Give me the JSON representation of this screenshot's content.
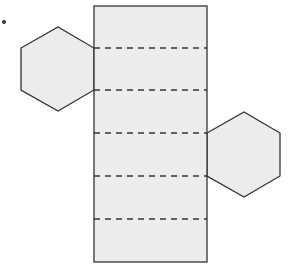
{
  "figure": {
    "colors": {
      "fill": "#ececec",
      "stroke": "#333333",
      "background": "#ffffff"
    },
    "bullet": {
      "cx": 4,
      "cy": 22,
      "r": 2
    },
    "rectangle": {
      "x": 94,
      "y": 6,
      "width": 113,
      "height": 256
    },
    "fold_lines_y": [
      48,
      90,
      133,
      176,
      219
    ],
    "hexagons": [
      {
        "name": "left-hexagon",
        "points": "21,48 58,27 94,48 94,90 58,111 21,90"
      },
      {
        "name": "right-hexagon",
        "points": "207,133 244,112 280,133 280,176 244,197 207,176"
      }
    ]
  }
}
